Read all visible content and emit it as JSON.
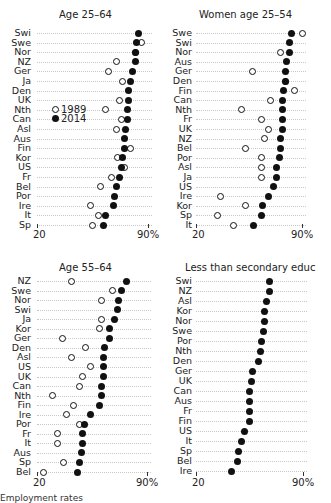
{
  "chart_data": [
    {
      "type": "scatter",
      "title": "Age 25–64",
      "xlim": [
        20,
        90
      ],
      "xticks": [
        "20",
        "90%"
      ],
      "legend": [
        "1989",
        "2014"
      ],
      "categories": [
        "Swi",
        "Swe",
        "Nor",
        "NZ",
        "Ger",
        "Ja",
        "Den",
        "UK",
        "Nth",
        "Can",
        "Asl",
        "Aus",
        "Fin",
        "Kor",
        "US",
        "Fr",
        "Bel",
        "Por",
        "Ire",
        "It",
        "Sp"
      ],
      "series": [
        {
          "name": "1989",
          "values": [
            null,
            86,
            82,
            70,
            65,
            74,
            null,
            72,
            63,
            73,
            70,
            null,
            79,
            71,
            75,
            67,
            60,
            null,
            54,
            59,
            55
          ]
        },
        {
          "name": "2014",
          "values": [
            84,
            83,
            82,
            82,
            80,
            79,
            78,
            78,
            77,
            77,
            76,
            75,
            75,
            74,
            73,
            72,
            70,
            69,
            68,
            63,
            62
          ]
        }
      ]
    },
    {
      "type": "scatter",
      "title": "Women age 25–54",
      "xlim": [
        20,
        90
      ],
      "xticks": [
        "20",
        "90%"
      ],
      "legend": [
        "1989",
        "2014"
      ],
      "categories": [
        "Swe",
        "Swi",
        "Nor",
        "Aus",
        "Ger",
        "Den",
        "Fin",
        "Can",
        "Nth",
        "Fr",
        "UK",
        "NZ",
        "Bel",
        "Por",
        "Asl",
        "Ja",
        "US",
        "Ire",
        "Kor",
        "Sp",
        "It"
      ],
      "series": [
        {
          "name": "1989",
          "values": [
            90,
            null,
            76,
            null,
            57,
            79,
            85,
            69,
            50,
            63,
            68,
            65,
            53,
            63,
            63,
            63,
            null,
            36,
            53,
            34,
            45
          ]
        },
        {
          "name": "2014",
          "values": [
            83,
            82,
            82,
            80,
            79,
            79,
            78,
            77,
            77,
            77,
            77,
            76,
            76,
            75,
            73,
            73,
            71,
            68,
            64,
            63,
            58
          ]
        }
      ]
    },
    {
      "type": "scatter",
      "title": "Age 55–64",
      "xlim": [
        20,
        90
      ],
      "xticks": [
        "20",
        "90%"
      ],
      "legend": [],
      "categories": [
        "NZ",
        "Swe",
        "Nor",
        "Swi",
        "Ja",
        "Kor",
        "Ger",
        "Den",
        "Asl",
        "US",
        "UK",
        "Can",
        "Nth",
        "Fin",
        "Ire",
        "Por",
        "Fr",
        "It",
        "Aus",
        "Sp",
        "Bel"
      ],
      "series": [
        {
          "name": "1989",
          "values": [
            42,
            68,
            61,
            null,
            61,
            60,
            36,
            51,
            42,
            54,
            49,
            47,
            30,
            43,
            39,
            47,
            33,
            33,
            null,
            37,
            24
          ]
        },
        {
          "name": "2014",
          "values": [
            77,
            74,
            72,
            71,
            69,
            66,
            66,
            63,
            62,
            62,
            62,
            61,
            61,
            60,
            54,
            50,
            49,
            49,
            48,
            47,
            46
          ]
        }
      ]
    },
    {
      "type": "scatter",
      "title": "Less than secondary educ",
      "xlim": [
        20,
        90
      ],
      "xticks": [
        "20",
        "90%"
      ],
      "legend": [],
      "categories": [
        "Swi",
        "NZ",
        "Asl",
        "Kor",
        "Nor",
        "Swe",
        "Por",
        "Nth",
        "Den",
        "Ger",
        "UK",
        "Can",
        "Aus",
        "Fr",
        "Fin",
        "US",
        "It",
        "Sp",
        "Bel",
        "Ire"
      ],
      "series": [
        {
          "name": "2014",
          "values": [
            68,
            68,
            66,
            65,
            65,
            64,
            63,
            62,
            61,
            57,
            56,
            55,
            55,
            55,
            55,
            52,
            50,
            48,
            47,
            43
          ]
        }
      ]
    }
  ],
  "panels": [
    {
      "title": "Age 25–64",
      "x_min_label": "20",
      "x_max_label": "90%",
      "legend": {
        "open_label": "1989",
        "filled_label": "2014"
      }
    },
    {
      "title": "Women age 25–54",
      "x_min_label": "20",
      "x_max_label": "90%"
    },
    {
      "title": "Age 55–64",
      "x_min_label": "20",
      "x_max_label": "90%"
    },
    {
      "title": "Less than secondary educ",
      "x_min_label": "20",
      "x_max_label": "90%"
    }
  ],
  "footnote": "Employment rates"
}
